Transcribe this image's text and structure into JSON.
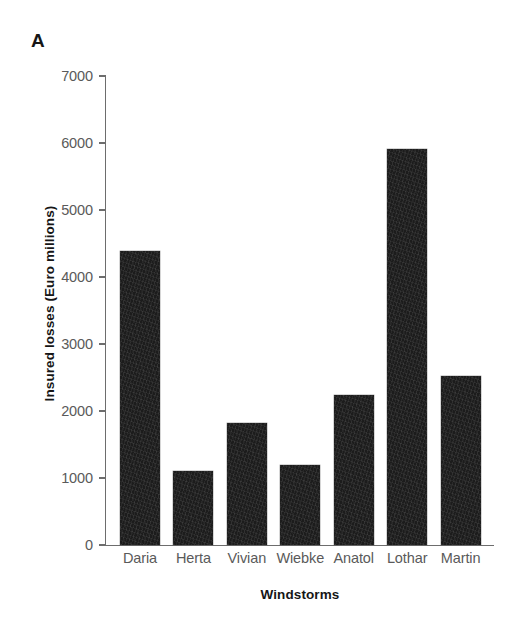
{
  "figure": {
    "panel_label": "A",
    "background_color": "#ffffff"
  },
  "chart_data": {
    "type": "bar",
    "title": "",
    "subtitle": "",
    "xlabel": "Windstorms",
    "ylabel": "Insured losses (Euro millions)",
    "categories": [
      "Daria",
      "Herta",
      "Vivian",
      "Wiebke",
      "Anatol",
      "Lothar",
      "Martin"
    ],
    "values": [
      4390,
      1100,
      1820,
      1190,
      2240,
      5910,
      2520
    ],
    "ylim": [
      0,
      7000
    ],
    "ytick_labels": [
      "0",
      "1000",
      "2000",
      "3000",
      "4000",
      "5000",
      "6000",
      "7000"
    ],
    "ytick_values": [
      0,
      1000,
      2000,
      3000,
      4000,
      5000,
      6000,
      7000
    ],
    "grid": false,
    "legend": null,
    "bar_color": "#1c1c1c",
    "axis_color": "#6d6d6d",
    "tick_label_color": "#5a5a5a",
    "axis_title_color": "#161616"
  }
}
